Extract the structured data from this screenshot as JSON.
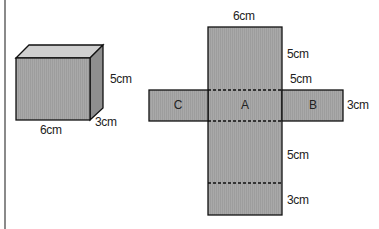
{
  "figure": {
    "cuboid": {
      "labels": {
        "height": "5cm",
        "depth": "3cm",
        "width": "6cm"
      }
    },
    "net": {
      "faces": {
        "left": "C",
        "center": "A",
        "right": "B"
      },
      "labels": {
        "top_width": "6cm",
        "top_height": "5cm",
        "side_width": "5cm",
        "side_height": "3cm",
        "lower_height": "5cm",
        "bottom_height": "3cm"
      }
    },
    "colors": {
      "face": "#a8a8a8",
      "top": "#c8c8c8",
      "side": "#8c8c8c",
      "outline": "#111111"
    }
  }
}
